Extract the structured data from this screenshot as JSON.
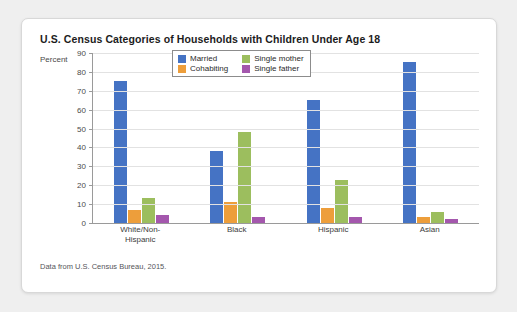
{
  "card": {
    "title": "U.S. Census Categories of Households with Children Under Age 18",
    "axis_unit": "Percent",
    "source_note": "Data from U.S. Census Bureau, 2015."
  },
  "colors": {
    "married": "#4573c4",
    "cohabiting": "#ed9e3b",
    "single_mother": "#9cbe5e",
    "single_father": "#a457ad",
    "page_background": "#efefef",
    "card_background": "#ffffff",
    "gridline": "#e2e2e2",
    "axis": "#9a9a9a"
  },
  "chart_data": {
    "type": "bar",
    "title": "U.S. Census Categories of Households with Children Under Age 18",
    "xlabel": "",
    "ylabel": "Percent",
    "ylim": [
      0,
      90
    ],
    "yticks": [
      0,
      10,
      20,
      30,
      40,
      50,
      60,
      70,
      80,
      90
    ],
    "ytick_labels": [
      "0",
      "10",
      "20",
      "30",
      "40",
      "50",
      "60",
      "70",
      "80",
      "90"
    ],
    "grid": true,
    "legend_position": "top-center",
    "categories": [
      "White/Non-Hispanic",
      "Black",
      "Hispanic",
      "Asian"
    ],
    "category_lines": [
      [
        "White/Non-",
        "Hispanic"
      ],
      [
        "Black"
      ],
      [
        "Hispanic"
      ],
      [
        "Asian"
      ]
    ],
    "series": [
      {
        "name": "Married",
        "color": "#4573c4",
        "values": [
          75,
          38,
          65,
          85
        ]
      },
      {
        "name": "Cohabiting",
        "color": "#ed9e3b",
        "values": [
          7,
          11,
          8,
          3
        ]
      },
      {
        "name": "Single mother",
        "color": "#9cbe5e",
        "values": [
          13,
          48,
          23,
          6
        ]
      },
      {
        "name": "Single father",
        "color": "#a457ad",
        "values": [
          4,
          3,
          3,
          2
        ]
      }
    ],
    "annotation": "Data from U.S. Census Bureau, 2015."
  }
}
